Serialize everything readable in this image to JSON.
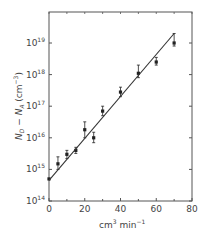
{
  "chart_data": {
    "type": "scatter",
    "title": "",
    "xlabel": "cm³ min⁻¹",
    "ylabel": "N_D − N_A (cm⁻³)",
    "xlim": [
      0,
      80
    ],
    "ylim": [
      100000000000000.0,
      1e+20
    ],
    "yscale": "log",
    "x_ticks": [
      0,
      20,
      40,
      60,
      80
    ],
    "x_minor_ticks": [
      10,
      30,
      50,
      70
    ],
    "y_ticks": [
      {
        "base": "10",
        "exp": "14"
      },
      {
        "base": "10",
        "exp": "15"
      },
      {
        "base": "10",
        "exp": "16"
      },
      {
        "base": "10",
        "exp": "17"
      },
      {
        "base": "10",
        "exp": "18"
      },
      {
        "base": "10",
        "exp": "19"
      }
    ],
    "grid": false,
    "legend": null,
    "series": [
      {
        "name": "data",
        "marker": "filled-square",
        "x": [
          0,
          5,
          10,
          15,
          20,
          25,
          30,
          40,
          50,
          60,
          70
        ],
        "y": [
          500000000000000.0,
          1500000000000000.0,
          3000000000000000.0,
          4000000000000000.0,
          1.8e+16,
          1e+16,
          7e+16,
          2.8e+17,
          1.1e+18,
          2.5e+18,
          1e+19
        ],
        "err_upper": [
          500000000000000.0,
          2500000000000000.0,
          4000000000000000.0,
          5000000000000000.0,
          3.2e+16,
          1.5e+16,
          1e+17,
          4e+17,
          2e+18,
          3.5e+18,
          2e+19
        ],
        "err_lower": [
          500000000000000.0,
          1000000000000000.0,
          2200000000000000.0,
          3200000000000000.0,
          1e+16,
          7000000000000000.0,
          5e+16,
          2e+17,
          8e+17,
          2e+18,
          8e+18
        ]
      },
      {
        "name": "fit",
        "style": "line",
        "x": [
          0,
          70
        ],
        "y": [
          450000000000000.0,
          2e+19
        ]
      }
    ]
  },
  "labels": {
    "x_axis": "cm",
    "x_axis_sup1": "3",
    "x_axis_mid": " min",
    "x_axis_sup2": "−1",
    "y_axis_main": "N",
    "y_axis_sub1": "D",
    "y_axis_mid": " − N",
    "y_axis_sub2": "A",
    "y_axis_unit": " (cm",
    "y_axis_unit_sup": "−3",
    "y_axis_close": ")"
  }
}
